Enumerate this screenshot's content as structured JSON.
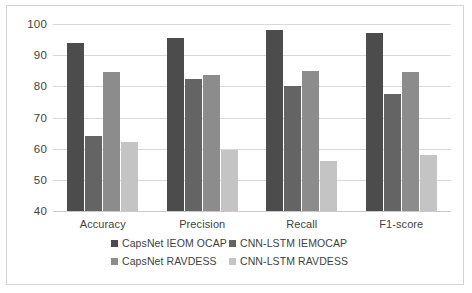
{
  "chart_data": {
    "type": "bar",
    "title": "",
    "xlabel": "",
    "ylabel": "",
    "ylim": [
      40,
      100
    ],
    "ytick_step": 10,
    "yticks": [
      "100",
      "90",
      "80",
      "70",
      "60",
      "50",
      "40"
    ],
    "grid": "horizontal",
    "legend_position": "bottom",
    "categories": [
      "Accuracy",
      "Precision",
      "Recall",
      "F1-score"
    ],
    "series": [
      {
        "name": "CapsNet IEOM OCAP",
        "color": "#4c4c4c",
        "values": [
          94,
          95.5,
          98,
          97
        ]
      },
      {
        "name": "CNN-LSTM IEMOCAP",
        "color": "#646464",
        "values": [
          64,
          82.5,
          80,
          77.5
        ]
      },
      {
        "name": "CapsNet RAVDESS",
        "color": "#8c8c8c",
        "values": [
          84.5,
          83.5,
          85,
          84.5
        ]
      },
      {
        "name": "CNN-LSTM RAVDESS",
        "color": "#c4c4c4",
        "values": [
          62,
          59.5,
          56,
          58
        ]
      }
    ]
  },
  "figure": {
    "border_color": "#d4d4d4",
    "background": "#ffffff",
    "gridline_color": "#d9d9d9"
  }
}
